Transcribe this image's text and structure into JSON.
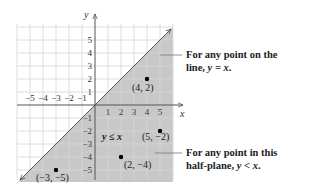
{
  "diagram": {
    "type": "coordinate-plane-half-plane",
    "x_axis": {
      "label": "x",
      "ticks": [
        "−5",
        "−4",
        "−3",
        "−2",
        "−1",
        "1",
        "2",
        "3",
        "4",
        "5"
      ]
    },
    "y_axis": {
      "label": "y",
      "ticks": [
        "5",
        "4",
        "3",
        "2",
        "1",
        "−1",
        "−2",
        "−3",
        "−4",
        "−5"
      ]
    },
    "boundary_line": "y = x",
    "shaded_region": "y ≤ x",
    "inequality_label": "y ≤ x",
    "points": [
      {
        "label": "(4, 2)",
        "x": 4,
        "y": 2
      },
      {
        "label": "(5, −2)",
        "x": 5,
        "y": -2
      },
      {
        "label": "(2, −4)",
        "x": 2,
        "y": -4
      },
      {
        "label": "(−3, −5)",
        "x": -3,
        "y": -5
      }
    ],
    "annotations": [
      {
        "line1": "For any point on the",
        "line2_prefix": "line, ",
        "line2_math": "y = x",
        "line2_suffix": "."
      },
      {
        "line1": "For any point in this",
        "line2_prefix": "half-plane, ",
        "line2_math": "y < x",
        "line2_suffix": "."
      }
    ],
    "colors": {
      "shade": "#c8c8c8",
      "grid": "#d9d9d9",
      "axis": "#555555",
      "line": "#555555",
      "point": "#000000"
    }
  }
}
